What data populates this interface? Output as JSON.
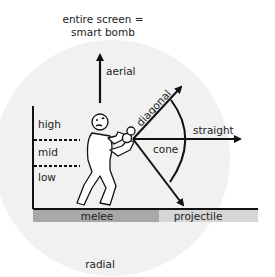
{
  "labels": {
    "top_line1": "entire screen =",
    "top_line2": "smart bomb",
    "aerial": "aerial",
    "diagonal": "diagonal",
    "straight": "straight",
    "cone": "cone",
    "high": "high",
    "mid": "mid",
    "low": "low",
    "melee": "melee",
    "projectile": "projectile",
    "radial": "radial"
  },
  "colors": {
    "radial_fill": "#f1f1f1",
    "melee_bar": "#a8a8a8",
    "projectile_bar": "#d6d6d6",
    "ink": "#111111"
  }
}
